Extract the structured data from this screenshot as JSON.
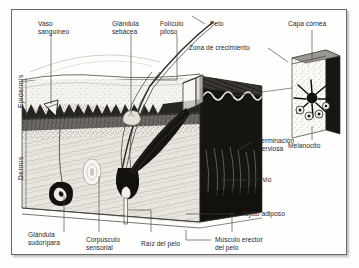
{
  "figure": {
    "language": "es",
    "frame": {
      "border_color": "#6a6a68",
      "background": "#fefefc"
    },
    "ink_color": "#26262a"
  },
  "axis_labels": [
    {
      "name": "epidermis",
      "text": "Epidermis"
    },
    {
      "name": "dermis",
      "text": "Dermis"
    }
  ],
  "labels": [
    {
      "name": "vaso-sanguineo",
      "text": "Vaso\nsanguíneo"
    },
    {
      "name": "glandula-sebacea",
      "text": "Glándula\nsebácea"
    },
    {
      "name": "foliculo-piloso",
      "text": "Folículo\npiloso"
    },
    {
      "name": "pelo",
      "text": "Pelo"
    },
    {
      "name": "capa-cornea",
      "text": "Capa córnea"
    },
    {
      "name": "zona-de-crecimiento",
      "text": "Zona de crecimiento"
    },
    {
      "name": "melanocito",
      "text": "Melanocito"
    },
    {
      "name": "terminacion-nerviosa",
      "text": "Terminación\nnerviosa"
    },
    {
      "name": "nervio",
      "text": "Nervio"
    },
    {
      "name": "tejido-adiposo",
      "text": "Tejido adiposo"
    },
    {
      "name": "glandula-sudoripara",
      "text": "Glándula\nsudorípara"
    },
    {
      "name": "corpusculo-sensorial",
      "text": "Corpúsculo\nsensorial"
    },
    {
      "name": "raiz-del-pelo",
      "text": "Raíz del pelo"
    },
    {
      "name": "musculo-erector-del-pelo",
      "text": "Músculo erector\ndel pelo"
    }
  ]
}
